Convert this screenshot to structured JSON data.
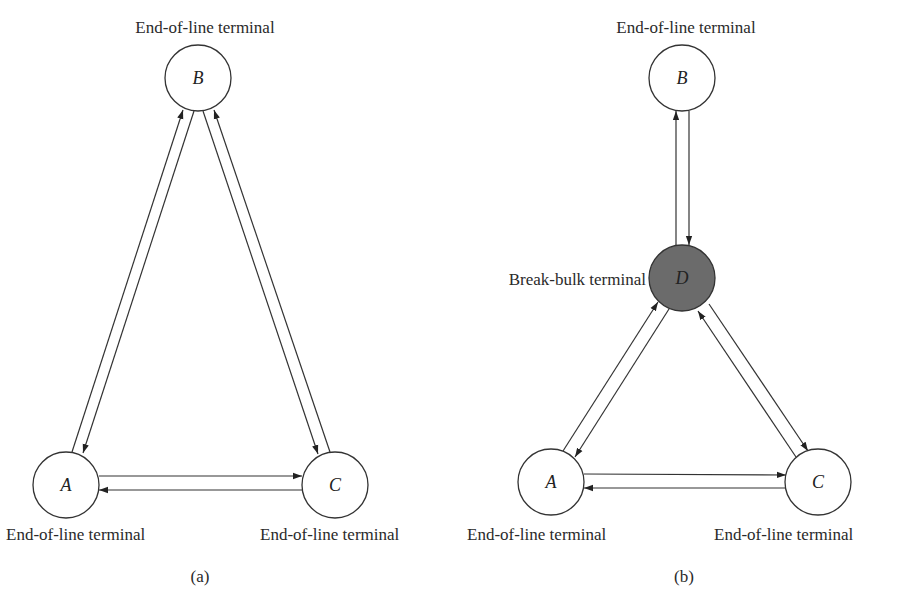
{
  "colors": {
    "stroke": "#333333",
    "node_fill": "#ffffff",
    "breakbulk_fill": "#6b6b6b",
    "text": "#2a2a2a"
  },
  "diagram_a": {
    "caption": "(a)",
    "nodes": {
      "A": {
        "id": "A",
        "label": "End-of-line terminal"
      },
      "B": {
        "id": "B",
        "label": "End-of-line terminal"
      },
      "C": {
        "id": "C",
        "label": "End-of-line terminal"
      }
    },
    "edges": [
      {
        "from": "A",
        "to": "B"
      },
      {
        "from": "B",
        "to": "A"
      },
      {
        "from": "B",
        "to": "C"
      },
      {
        "from": "C",
        "to": "B"
      },
      {
        "from": "A",
        "to": "C"
      },
      {
        "from": "C",
        "to": "A"
      }
    ]
  },
  "diagram_b": {
    "caption": "(b)",
    "nodes": {
      "A": {
        "id": "A",
        "label": "End-of-line terminal"
      },
      "B": {
        "id": "B",
        "label": "End-of-line terminal"
      },
      "C": {
        "id": "C",
        "label": "End-of-line terminal"
      },
      "D": {
        "id": "D",
        "label": "Break-bulk terminal"
      }
    },
    "edges": [
      {
        "from": "D",
        "to": "B"
      },
      {
        "from": "B",
        "to": "D"
      },
      {
        "from": "A",
        "to": "D"
      },
      {
        "from": "D",
        "to": "A"
      },
      {
        "from": "D",
        "to": "C"
      },
      {
        "from": "C",
        "to": "D"
      },
      {
        "from": "A",
        "to": "C"
      },
      {
        "from": "C",
        "to": "A"
      }
    ]
  }
}
